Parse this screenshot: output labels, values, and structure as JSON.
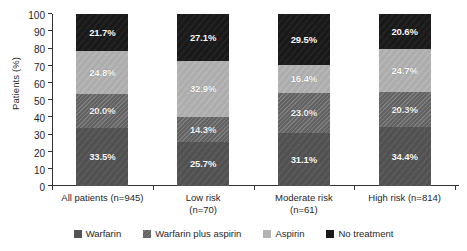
{
  "chart_data": {
    "type": "bar",
    "subtype": "stacked-column-100",
    "title": "",
    "xlabel": "",
    "ylabel": "Patients (%)",
    "ylim": [
      0,
      100
    ],
    "ytick_step": 10,
    "yticks": [
      100,
      90,
      80,
      70,
      60,
      50,
      40,
      30,
      20,
      10,
      0
    ],
    "grid": false,
    "legend_position": "bottom",
    "value_label_suffix": "%",
    "categories": [
      "All patients (n=945)",
      "Low risk (n=70)",
      "Moderate risk (n=61)",
      "High risk (n=814)"
    ],
    "category_lines": [
      [
        "All patients (n=945)"
      ],
      [
        "Low risk",
        "(n=70)"
      ],
      [
        "Moderate risk",
        "(n=61)"
      ],
      [
        "High risk (n=814)"
      ]
    ],
    "series": [
      {
        "name": "Warfarin",
        "color": "#545454",
        "pattern": "solid",
        "values": [
          33.5,
          25.7,
          31.1,
          34.4
        ],
        "labels": [
          "33.5%",
          "25.7%",
          "31.1%",
          "34.4%"
        ]
      },
      {
        "name": "Warfarin plus aspirin",
        "color": "#6e6e6e",
        "pattern": "diagonal-hatch",
        "values": [
          20.0,
          14.3,
          23.0,
          20.3
        ],
        "labels": [
          "20.0%",
          "14.3%",
          "23.0%",
          "20.3%"
        ]
      },
      {
        "name": "Aspirin",
        "color": "#b3b3b3",
        "pattern": "solid",
        "values": [
          24.8,
          32.9,
          16.4,
          24.7
        ],
        "labels": [
          "24.8%",
          "32.9%",
          "16.4%",
          "24.7%"
        ]
      },
      {
        "name": "No treatment",
        "color": "#1a1a1a",
        "pattern": "solid",
        "values": [
          21.7,
          27.1,
          29.5,
          20.6
        ],
        "labels": [
          "21.7%",
          "27.1%",
          "29.5%",
          "20.6%"
        ]
      }
    ]
  },
  "legend": {
    "items": [
      {
        "label": "Warfarin",
        "color": "#545454"
      },
      {
        "label": "Warfarin plus aspirin",
        "color": "#6e6e6e"
      },
      {
        "label": "Aspirin",
        "color": "#b3b3b3"
      },
      {
        "label": "No treatment",
        "color": "#1a1a1a"
      }
    ]
  }
}
